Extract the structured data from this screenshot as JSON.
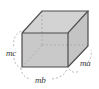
{
  "figure": {
    "kind": "geometry-diagram",
    "shape_name": "rectangular-box",
    "projection": "oblique",
    "background_color": "#ffffff",
    "face_fill_front": "#c9c9c9",
    "face_fill_top": "#d3d3d3",
    "face_fill_side": "#c4c4c4",
    "edge_color": "#4d4d4d",
    "hidden_edge_color": "#a8a8a8",
    "guide_color": "#9a9a9a",
    "label_color": "#3a3a3a",
    "labels": {
      "height": "mc",
      "width": "mb",
      "depth": "ma"
    },
    "label_positions": {
      "height": "left",
      "width": "bottom",
      "depth": "right"
    },
    "edges": {
      "visible_count": 9,
      "hidden_count": 3
    },
    "dimension_guides": {
      "height_guide": "dashed-arc-left",
      "width_guide": "dashed-arc-bottom",
      "depth_guide": "dashed-arc-right"
    }
  }
}
